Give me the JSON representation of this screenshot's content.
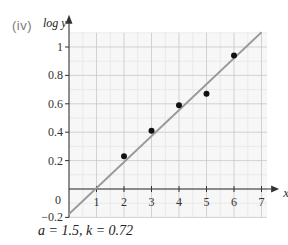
{
  "panel_label": "(iv)",
  "y_axis_label": "log y",
  "x_axis_label": "x",
  "caption": "a = 1.5, k = 0.72",
  "colors": {
    "grid_major": "#c8c8c8",
    "grid_minor": "#e6e6e6",
    "grid_bg": "#f7f7f7",
    "axis": "#333333",
    "line": "#999999",
    "points": "#111111"
  },
  "chart_data": {
    "type": "scatter",
    "title": "",
    "xlabel": "x",
    "ylabel": "log y",
    "xlim": [
      0,
      7
    ],
    "ylim": [
      -0.2,
      1.1
    ],
    "x_ticks": [
      "1",
      "2",
      "3",
      "4",
      "5",
      "6",
      "7"
    ],
    "y_ticks": [
      "-0.2",
      "0",
      "0.2",
      "0.4",
      "0.6",
      "0.8",
      "1"
    ],
    "grid": true,
    "series": [
      {
        "name": "data points",
        "type": "scatter",
        "x": [
          2,
          3,
          4,
          5,
          6
        ],
        "y": [
          0.23,
          0.41,
          0.59,
          0.67,
          0.94
        ]
      },
      {
        "name": "line of best fit",
        "type": "line",
        "x": [
          0,
          7
        ],
        "y": [
          -0.176,
          1.104
        ]
      }
    ],
    "annotations": [
      "a = 1.5, k = 0.72"
    ]
  }
}
